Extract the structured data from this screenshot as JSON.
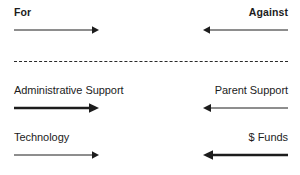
{
  "diagram": {
    "type": "force-field",
    "background_color": "#ffffff",
    "text_color": "#1c1c1c",
    "arrow_color": "#1c1c1c",
    "divider": {
      "name": "dashed-divider",
      "style": "dashed",
      "color": "#2a2a2a",
      "orientation": "horizontal"
    },
    "rows": [
      {
        "index": 1,
        "left": {
          "label": "For",
          "weight": "bold",
          "direction": "right",
          "thickness": "thin"
        },
        "right": {
          "label": "Against",
          "weight": "bold",
          "direction": "left",
          "thickness": "thin"
        }
      },
      {
        "index": 2,
        "left": {
          "label": "Administrative Support",
          "weight": "normal",
          "direction": "right",
          "thickness": "thick"
        },
        "right": {
          "label": "Parent Support",
          "weight": "normal",
          "direction": "left",
          "thickness": "thin"
        }
      },
      {
        "index": 3,
        "left": {
          "label": "Technology",
          "weight": "normal",
          "direction": "right",
          "thickness": "thin"
        },
        "right": {
          "label": "$ Funds",
          "weight": "normal",
          "direction": "left",
          "thickness": "thick"
        }
      }
    ]
  }
}
